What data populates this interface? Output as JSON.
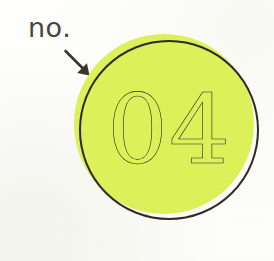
{
  "page": {
    "background_color": "#fdfdfa",
    "width": 274,
    "height": 261
  },
  "annotation": {
    "label": "no.",
    "label_color": "#4a4541",
    "arrow_icon": "arrow-down-right-icon",
    "arrow_color": "#3b342d",
    "arrow_points_to": "number-badge"
  },
  "badge": {
    "number": "04",
    "shape": "circle",
    "fill_color": "#dcf05a",
    "outline_color": "#2f2a24",
    "number_color": "#2b2620",
    "outline_width_px": 2.6,
    "fill_offset_px": {
      "x": -5,
      "y": -6
    }
  }
}
